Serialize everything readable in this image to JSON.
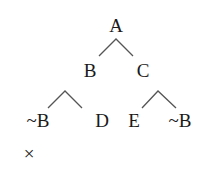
{
  "diagram": {
    "type": "logic-tableau-tree",
    "nodes": {
      "root": "A",
      "left": "B",
      "right": "C",
      "left_left": "~B",
      "left_right": "D",
      "right_left": "E",
      "right_right": "~B",
      "closed_mark": "×"
    }
  }
}
